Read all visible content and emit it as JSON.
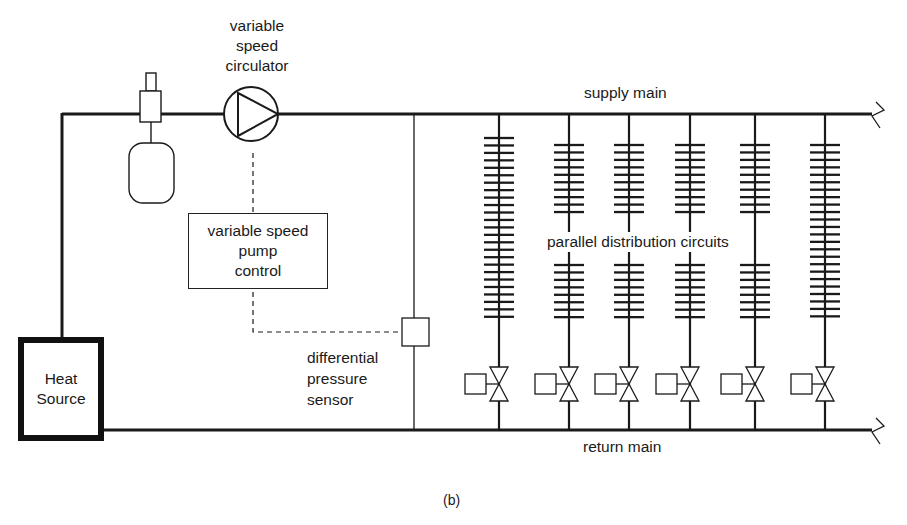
{
  "labels": {
    "circulator": [
      "variable",
      "speed",
      "circulator"
    ],
    "supply_main": "supply main",
    "return_main": "return main",
    "pump_control": [
      "variable speed",
      "pump",
      "control"
    ],
    "parallel_circuits": "parallel distribution circuits",
    "dp_sensor": [
      "differential",
      "pressure",
      "sensor"
    ],
    "heat_source": [
      "Heat",
      "Source"
    ],
    "caption": "(b)"
  },
  "colors": {
    "line": "#1a1a1a",
    "background": "#ffffff"
  },
  "geometry": {
    "supply_y": 114,
    "return_y": 430,
    "left_x": 62,
    "bypass_x": 414,
    "circuits": [
      {
        "x": 499,
        "top_fins": 25,
        "top_start": 138,
        "bottom_fins": 0,
        "valve_y": 384
      },
      {
        "x": 569,
        "top_fins": 10,
        "top_start": 145,
        "bottom_fins": 8,
        "bottom_start": 265,
        "valve_y": 384
      },
      {
        "x": 629,
        "top_fins": 10,
        "top_start": 145,
        "bottom_fins": 8,
        "bottom_start": 265,
        "valve_y": 384
      },
      {
        "x": 690,
        "top_fins": 10,
        "top_start": 145,
        "bottom_fins": 8,
        "bottom_start": 265,
        "valve_y": 384
      },
      {
        "x": 755,
        "top_fins": 10,
        "top_start": 145,
        "bottom_fins": 8,
        "bottom_start": 265,
        "valve_y": 384
      },
      {
        "x": 825,
        "top_fins": 24,
        "top_start": 145,
        "bottom_fins": 0,
        "valve_y": 384
      }
    ]
  }
}
